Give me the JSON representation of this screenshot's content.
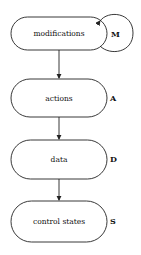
{
  "diagram": {
    "type": "flowchart",
    "nodes": [
      {
        "id": "modifications",
        "label": "modifications",
        "tag": "M"
      },
      {
        "id": "actions",
        "label": "actions",
        "tag": "A"
      },
      {
        "id": "data",
        "label": "data",
        "tag": "D"
      },
      {
        "id": "control_states",
        "label": "control states",
        "tag": "S"
      }
    ],
    "edges": [
      {
        "from": "modifications",
        "to": "modifications",
        "kind": "self-loop"
      },
      {
        "from": "modifications",
        "to": "actions"
      },
      {
        "from": "actions",
        "to": "data"
      },
      {
        "from": "data",
        "to": "control_states"
      }
    ],
    "colors": {
      "stroke": "#222222",
      "background": "#ffffff"
    }
  }
}
